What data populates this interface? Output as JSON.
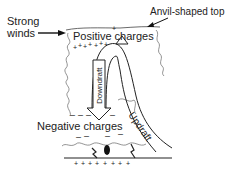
{
  "diagram": {
    "labels": {
      "strong_winds_line1": "Strong",
      "strong_winds_line2": "winds",
      "anvil_top": "Anvil-shaped top",
      "positive_charges": "Positive charges",
      "negative_charges": "Negative charges",
      "downdraft": "Downdraft",
      "updraft": "Updraft"
    },
    "symbols": {
      "plus": "+",
      "minus": "–"
    },
    "colors": {
      "ink": "#222222",
      "background": "#ffffff",
      "cloud_outline": "#555555"
    }
  }
}
